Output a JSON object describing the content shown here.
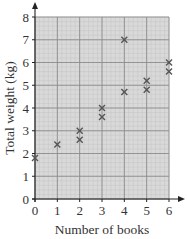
{
  "chart_data": {
    "type": "scatter",
    "title": "",
    "xlabel": "Number of books",
    "ylabel": "Total weight (kg)",
    "xlim": [
      0,
      6
    ],
    "ylim": [
      0,
      8
    ],
    "xticks": [
      0,
      1,
      2,
      3,
      4,
      5,
      6
    ],
    "yticks": [
      0,
      1,
      2,
      3,
      4,
      5,
      6,
      7,
      8
    ],
    "grid": true,
    "grid_minor_step": 0.2,
    "marker": "x",
    "legend": null,
    "series": [
      {
        "name": "books",
        "points": [
          {
            "x": 0,
            "y": 1.8
          },
          {
            "x": 1,
            "y": 2.4
          },
          {
            "x": 2,
            "y": 2.6
          },
          {
            "x": 2,
            "y": 3.0
          },
          {
            "x": 3,
            "y": 3.6
          },
          {
            "x": 3,
            "y": 4.0
          },
          {
            "x": 4,
            "y": 4.7
          },
          {
            "x": 4,
            "y": 7.0
          },
          {
            "x": 5,
            "y": 4.8
          },
          {
            "x": 5,
            "y": 5.2
          },
          {
            "x": 6,
            "y": 5.6
          },
          {
            "x": 6,
            "y": 6.0
          }
        ]
      }
    ]
  },
  "colors": {
    "grid_background": "#d9d9d9",
    "major_grid": "#8c8c8c",
    "minor_grid": "#c4c4c4",
    "axis": "#222222",
    "marker": "#555555",
    "text": "#333333"
  }
}
